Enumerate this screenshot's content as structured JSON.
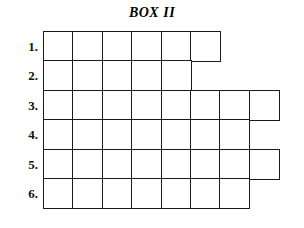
{
  "title": "BOX II",
  "grid": {
    "cell_size_px": 31,
    "origin_x_px": 43,
    "origin_y_px": 31,
    "border_color": "#1a1a1a",
    "cell_fill": "#ffffff",
    "rows": [
      {
        "label": "1.",
        "cells": 6,
        "values": [
          "",
          "",
          "",
          "",
          "",
          ""
        ]
      },
      {
        "label": "2.",
        "cells": 5,
        "values": [
          "",
          "",
          "",
          "",
          ""
        ]
      },
      {
        "label": "3.",
        "cells": 8,
        "values": [
          "",
          "",
          "",
          "",
          "",
          "",
          "",
          ""
        ]
      },
      {
        "label": "4.",
        "cells": 7,
        "values": [
          "",
          "",
          "",
          "",
          "",
          "",
          ""
        ]
      },
      {
        "label": "5.",
        "cells": 8,
        "values": [
          "",
          "",
          "",
          "",
          "",
          "",
          "",
          ""
        ]
      },
      {
        "label": "6.",
        "cells": 7,
        "values": [
          "",
          "",
          "",
          "",
          "",
          "",
          ""
        ]
      }
    ]
  }
}
